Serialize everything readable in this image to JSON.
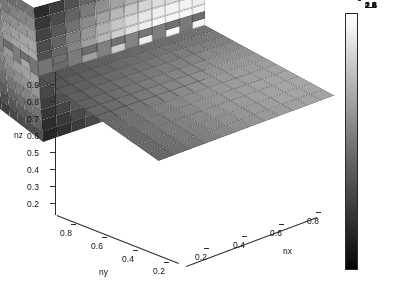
{
  "figure": {
    "kind": "matlab-3d-voxel-slice-plot",
    "background": "#ffffff"
  },
  "chart_data": {
    "type": "heatmap",
    "title": "",
    "subtitle": "",
    "render_style": "3d-voxel-blocks",
    "xlabel": "nx",
    "ylabel": "ny",
    "zlabel": "nz",
    "xticks": [
      "0.2",
      "0.4",
      "0.6",
      "0.8"
    ],
    "yticks": [
      "0.8",
      "0.6",
      "0.4",
      "0.2"
    ],
    "zticks": [
      "0.9",
      "0.8",
      "0.7",
      "0.6",
      "0.5",
      "0.4",
      "0.3",
      "0.2"
    ],
    "xlim": [
      0.1,
      0.9
    ],
    "ylim": [
      0.1,
      0.9
    ],
    "zlim": [
      0.15,
      0.95
    ],
    "grid": false,
    "legend": "none",
    "colormap": "gray",
    "clim": [
      0.7,
      3.0
    ],
    "colorbar": {
      "position": "right",
      "orientation": "vertical",
      "ticks": [
        "2.8",
        "2.6",
        "2.4",
        "2.2",
        "2",
        "1.8",
        "1.6",
        "1.4",
        "1.2",
        "1",
        "0.8"
      ],
      "values": [
        2.8,
        2.6,
        2.4,
        2.2,
        2.0,
        1.8,
        1.6,
        1.4,
        1.2,
        1.0,
        0.8
      ],
      "low_color": "#000000",
      "high_color": "#ffffff"
    },
    "nx_cells": 12,
    "ny_cells": 12,
    "nz_cells": 12,
    "faces": {
      "top": {
        "description": "top surface z=max, dark mid-grey with lighter ridge toward far corner",
        "value_range": [
          1.5,
          2.3
        ]
      },
      "left": {
        "description": "ny face, dark at top rows, brightening strongly toward lower-front",
        "value_range": [
          0.8,
          3.0
        ]
      },
      "right": {
        "description": "nx face, bright near front corner, darkening toward right edge",
        "value_range": [
          0.9,
          2.9
        ]
      }
    },
    "top_values": [
      [
        1.62,
        1.66,
        1.7,
        1.74,
        1.78,
        1.82,
        1.86,
        1.88,
        1.9,
        1.92,
        1.94,
        1.95
      ],
      [
        1.66,
        1.71,
        1.76,
        1.8,
        1.85,
        1.89,
        1.93,
        1.96,
        1.98,
        2.0,
        2.02,
        2.03
      ],
      [
        1.7,
        1.76,
        1.82,
        1.87,
        1.92,
        1.97,
        2.01,
        2.04,
        2.07,
        2.09,
        2.11,
        2.12
      ],
      [
        1.74,
        1.8,
        1.87,
        1.93,
        1.99,
        2.04,
        2.09,
        2.12,
        2.15,
        2.18,
        2.2,
        2.21
      ],
      [
        1.78,
        1.85,
        1.92,
        1.99,
        2.05,
        2.11,
        2.16,
        2.2,
        2.24,
        2.26,
        2.28,
        2.29
      ],
      [
        1.82,
        1.89,
        1.97,
        2.04,
        2.11,
        2.17,
        2.23,
        2.27,
        2.31,
        2.34,
        2.36,
        2.37
      ],
      [
        1.84,
        1.92,
        2.0,
        2.08,
        2.15,
        2.22,
        2.28,
        2.33,
        2.37,
        2.4,
        2.42,
        2.43
      ],
      [
        1.85,
        1.94,
        2.02,
        2.11,
        2.18,
        2.25,
        2.32,
        2.37,
        2.41,
        2.44,
        2.47,
        2.48
      ],
      [
        1.86,
        1.95,
        2.04,
        2.12,
        2.2,
        2.28,
        2.34,
        2.4,
        2.44,
        2.48,
        2.5,
        2.51
      ],
      [
        1.86,
        1.95,
        2.04,
        2.13,
        2.21,
        2.29,
        2.36,
        2.41,
        2.46,
        2.49,
        2.52,
        2.53
      ],
      [
        1.85,
        1.94,
        2.03,
        2.12,
        2.2,
        2.28,
        2.35,
        2.41,
        2.45,
        2.49,
        2.51,
        2.52
      ],
      [
        1.83,
        1.92,
        2.01,
        2.1,
        2.18,
        2.26,
        2.33,
        2.38,
        2.43,
        2.46,
        2.49,
        2.5
      ]
    ],
    "left_values": [
      [
        1.05,
        1.15,
        1.26,
        1.38,
        1.5,
        1.6,
        1.68,
        1.74,
        1.78,
        1.8,
        1.8,
        1.78
      ],
      [
        1.12,
        1.24,
        1.38,
        1.52,
        1.66,
        1.78,
        1.88,
        1.95,
        2.0,
        2.02,
        2.02,
        2.0
      ],
      [
        1.2,
        1.34,
        1.5,
        1.67,
        1.83,
        1.97,
        2.09,
        2.17,
        2.23,
        2.26,
        2.26,
        2.23
      ],
      [
        1.28,
        1.45,
        1.63,
        1.82,
        2.0,
        2.17,
        2.3,
        2.4,
        2.47,
        2.5,
        2.5,
        2.47
      ],
      [
        1.36,
        1.55,
        1.76,
        1.97,
        2.17,
        2.35,
        2.5,
        2.62,
        2.69,
        2.73,
        2.73,
        2.69
      ],
      [
        1.42,
        1.63,
        1.86,
        2.09,
        2.31,
        2.51,
        2.67,
        2.8,
        2.88,
        2.92,
        2.92,
        2.88
      ],
      [
        1.45,
        1.68,
        1.92,
        2.17,
        2.4,
        2.61,
        2.78,
        2.91,
        3.0,
        3.03,
        3.03,
        2.99
      ],
      [
        1.44,
        1.67,
        1.92,
        2.17,
        2.41,
        2.62,
        2.79,
        2.92,
        3.0,
        3.04,
        3.03,
        2.99
      ],
      [
        1.4,
        1.62,
        1.86,
        2.11,
        2.34,
        2.55,
        2.72,
        2.84,
        2.92,
        2.96,
        2.95,
        2.91
      ],
      [
        1.32,
        1.53,
        1.76,
        1.99,
        2.21,
        2.4,
        2.56,
        2.67,
        2.75,
        2.78,
        2.78,
        2.74
      ],
      [
        1.22,
        1.41,
        1.62,
        1.83,
        2.03,
        2.2,
        2.34,
        2.45,
        2.51,
        2.54,
        2.54,
        2.5
      ],
      [
        1.1,
        1.27,
        1.45,
        1.64,
        1.81,
        1.96,
        2.09,
        2.18,
        2.24,
        2.26,
        2.26,
        2.23
      ]
    ],
    "right_values": [
      [
        1.8,
        1.78,
        1.74,
        1.68,
        1.6,
        1.5,
        1.38,
        1.26,
        1.15,
        1.06,
        0.98,
        0.92
      ],
      [
        2.02,
        2.0,
        1.95,
        1.88,
        1.78,
        1.66,
        1.52,
        1.38,
        1.25,
        1.14,
        1.06,
        0.99
      ],
      [
        2.26,
        2.23,
        2.17,
        2.09,
        1.97,
        1.83,
        1.67,
        1.5,
        1.35,
        1.23,
        1.13,
        1.06
      ],
      [
        2.5,
        2.47,
        2.4,
        2.3,
        2.17,
        2.0,
        1.82,
        1.63,
        1.46,
        1.32,
        1.21,
        1.13
      ],
      [
        2.73,
        2.69,
        2.62,
        2.5,
        2.35,
        2.17,
        1.97,
        1.76,
        1.57,
        1.41,
        1.29,
        1.2
      ],
      [
        2.92,
        2.88,
        2.8,
        2.67,
        2.51,
        2.31,
        2.09,
        1.86,
        1.66,
        1.49,
        1.36,
        1.26
      ],
      [
        3.02,
        2.99,
        2.91,
        2.78,
        2.61,
        2.4,
        2.17,
        1.93,
        1.71,
        1.54,
        1.4,
        1.3
      ],
      [
        3.02,
        2.99,
        2.92,
        2.79,
        2.62,
        2.41,
        2.17,
        1.93,
        1.72,
        1.54,
        1.4,
        1.3
      ],
      [
        2.95,
        2.91,
        2.84,
        2.72,
        2.55,
        2.34,
        2.11,
        1.87,
        1.66,
        1.49,
        1.36,
        1.26
      ],
      [
        2.78,
        2.74,
        2.67,
        2.56,
        2.4,
        2.21,
        1.99,
        1.77,
        1.57,
        1.41,
        1.29,
        1.19
      ],
      [
        2.54,
        2.5,
        2.45,
        2.34,
        2.2,
        2.03,
        1.83,
        1.62,
        1.44,
        1.29,
        1.18,
        1.1
      ],
      [
        2.26,
        2.23,
        2.18,
        2.09,
        1.96,
        1.81,
        1.64,
        1.45,
        1.29,
        1.16,
        1.06,
        0.99
      ]
    ],
    "crest_values": [
      2.05,
      1.98,
      2.12,
      1.96,
      2.18,
      2.02,
      2.22,
      2.06,
      2.15,
      2.0,
      2.1,
      1.97
    ]
  },
  "axes": {
    "x": {
      "title": "nx",
      "ticks": [
        {
          "label": "0.2",
          "left": 195,
          "top": 252
        },
        {
          "label": "0.4",
          "left": 233,
          "top": 240
        },
        {
          "label": "0.6",
          "left": 270,
          "top": 228
        },
        {
          "label": "0.8",
          "left": 307,
          "top": 216
        }
      ],
      "title_pos": {
        "left": 283,
        "top": 246
      }
    },
    "y": {
      "title": "ny",
      "ticks": [
        {
          "label": "0.8",
          "left": 60,
          "top": 228
        },
        {
          "label": "0.6",
          "left": 91,
          "top": 241
        },
        {
          "label": "0.4",
          "left": 122,
          "top": 254
        },
        {
          "label": "0.2",
          "left": 153,
          "top": 266
        }
      ],
      "title_pos": {
        "left": 99,
        "top": 267
      }
    },
    "z": {
      "title": "nz",
      "ticks": [
        {
          "label": "0.9",
          "top": 80
        },
        {
          "label": "0.8",
          "top": 97
        },
        {
          "label": "0.7",
          "top": 114
        },
        {
          "label": "0.6",
          "top": 131
        },
        {
          "label": "0.5",
          "top": 148
        },
        {
          "label": "0.4",
          "top": 165
        },
        {
          "label": "0.3",
          "top": 182
        },
        {
          "label": "0.2",
          "top": 199
        }
      ],
      "title_pos": {
        "left": 14,
        "top": 130
      }
    }
  }
}
